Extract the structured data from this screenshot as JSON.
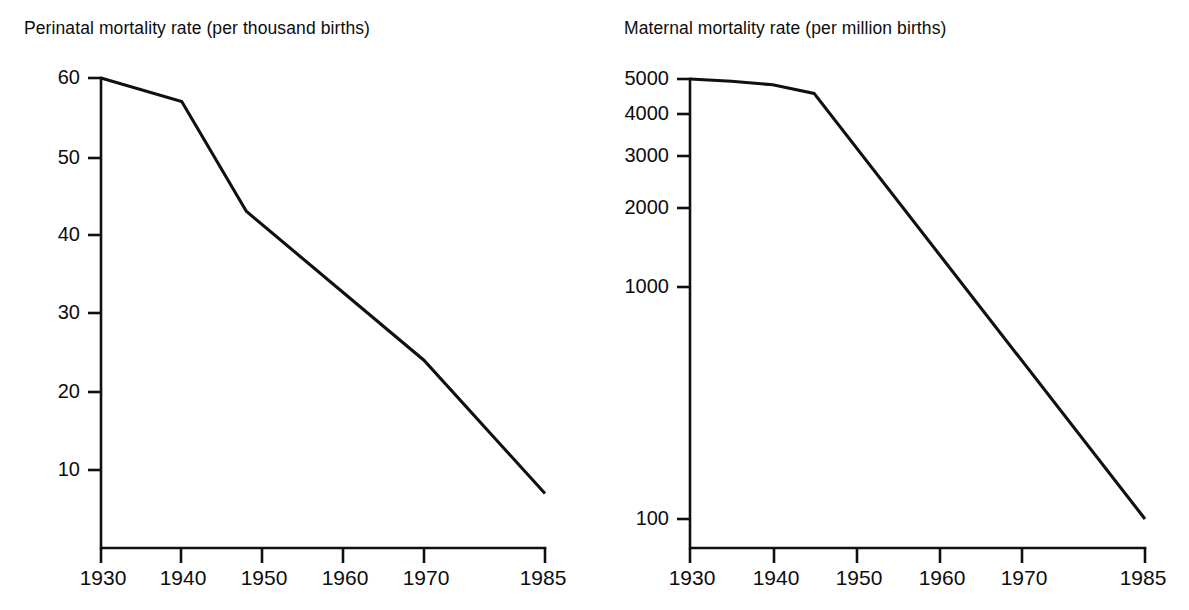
{
  "figure": {
    "background": "#ffffff",
    "ink_color": "#101010",
    "panel_count": 2
  },
  "chart_data": [
    {
      "id": "perinatal",
      "type": "line",
      "title": "Perinatal mortality rate (per thousand births)",
      "xlabel": "",
      "ylabel": "",
      "yscale": "linear",
      "xlim": [
        1930,
        1985
      ],
      "ylim": [
        0,
        62
      ],
      "grid": false,
      "legend": null,
      "xticks": [
        1930,
        1940,
        1950,
        1960,
        1970,
        1985
      ],
      "xtick_labels": [
        "1930",
        "1940",
        "1950",
        "1960",
        "1970",
        "1985"
      ],
      "yticks": [
        10,
        20,
        30,
        40,
        50,
        60
      ],
      "ytick_labels": [
        "10",
        "20",
        "30",
        "40",
        "50",
        "60"
      ],
      "series": [
        {
          "name": "Perinatal mortality rate",
          "x": [
            1930,
            1940,
            1948,
            1970,
            1985
          ],
          "values": [
            60,
            57,
            43,
            24,
            7
          ]
        }
      ]
    },
    {
      "id": "maternal",
      "type": "line",
      "title": "Maternal mortality rate (per million births)",
      "xlabel": "",
      "ylabel": "",
      "yscale": "log",
      "xlim": [
        1930,
        1985
      ],
      "ylim": [
        90,
        5200
      ],
      "grid": false,
      "legend": null,
      "xticks": [
        1930,
        1940,
        1950,
        1960,
        1970,
        1985
      ],
      "xtick_labels": [
        "1930",
        "1940",
        "1950",
        "1960",
        "1970",
        "1985"
      ],
      "yticks": [
        100,
        1000,
        2000,
        3000,
        4000,
        5000
      ],
      "ytick_labels": [
        "100",
        "1000",
        "2000",
        "3000",
        "4000",
        "5000"
      ],
      "series": [
        {
          "name": "Maternal mortality rate",
          "x": [
            1930,
            1935,
            1940,
            1945,
            1985
          ],
          "values": [
            5000,
            4900,
            4750,
            4400,
            100
          ]
        }
      ]
    }
  ],
  "panels": {
    "left": {
      "title": "Perinatal mortality rate (per thousand births)",
      "y_labels": [
        "60",
        "50",
        "40",
        "30",
        "20",
        "10"
      ],
      "x_labels": [
        "1930",
        "1940",
        "1950",
        "1960",
        "1970",
        "1985"
      ]
    },
    "right": {
      "title": "Maternal mortality rate (per million births)",
      "y_labels": [
        "5000",
        "4000",
        "3000",
        "2000",
        "1000",
        "100"
      ],
      "x_labels": [
        "1930",
        "1940",
        "1950",
        "1960",
        "1970",
        "1985"
      ]
    }
  }
}
